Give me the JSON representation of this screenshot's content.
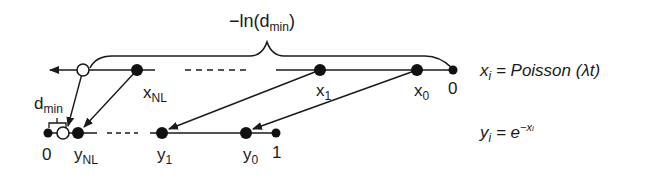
{
  "diagram": {
    "brace_label": {
      "prefix": "−ln(d",
      "sub": "min",
      "suffix": ")"
    },
    "top_axis": {
      "points": [
        {
          "id": "open-point",
          "x": 83,
          "filled": false
        },
        {
          "id": "x_NL",
          "x": 137,
          "filled": true,
          "label": "x",
          "sub": "NL"
        },
        {
          "id": "x_1",
          "x": 320,
          "filled": true,
          "label": "x",
          "sub": "1"
        },
        {
          "id": "x_0",
          "x": 417,
          "filled": true,
          "label": "x",
          "sub": "0"
        },
        {
          "id": "zero",
          "x": 453,
          "filled": true,
          "label": "0"
        }
      ]
    },
    "bottom_axis": {
      "points": [
        {
          "id": "zero",
          "x": 48,
          "filled": true,
          "label": "0"
        },
        {
          "id": "d_min-point",
          "x": 63,
          "filled": false
        },
        {
          "id": "y_NL",
          "x": 78,
          "filled": true,
          "label": "y",
          "sub": "NL"
        },
        {
          "id": "y_1",
          "x": 162,
          "filled": true,
          "label": "y",
          "sub": "1"
        },
        {
          "id": "y_0",
          "x": 246,
          "filled": true,
          "label": "y",
          "sub": "0"
        },
        {
          "id": "one",
          "x": 276,
          "filled": true,
          "label": "1"
        }
      ],
      "dmin_label": {
        "main": "d",
        "sub": "min"
      }
    },
    "equations": {
      "x_eq": {
        "lhs": "x",
        "lhs_sub": "i",
        "rhs": " = Poisson (λt)"
      },
      "y_eq": {
        "lhs": "y",
        "lhs_sub": "i",
        "rhs": " = e",
        "sup": "−x",
        "sup_sub": "i"
      }
    }
  }
}
